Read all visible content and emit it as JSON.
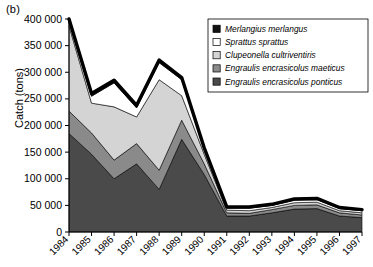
{
  "panel": {
    "label": "(b)"
  },
  "axis": {
    "ylabel": "Catch (tons)",
    "yticks": [
      "400 000",
      "350 000",
      "300 000",
      "250 000",
      "200 000",
      "150 000",
      "100 000",
      "50 000",
      "0"
    ],
    "xticks": [
      "1984",
      "1985",
      "1986",
      "1987",
      "1988",
      "1989",
      "1990",
      "1991",
      "1992",
      "1993",
      "1994",
      "1995",
      "1996",
      "1997"
    ]
  },
  "legend": {
    "items": [
      {
        "label": "Merlangius merlangus",
        "color": "#111111"
      },
      {
        "label": "Sprattus sprattus",
        "color": "#ffffff"
      },
      {
        "label": "Clupeonella cultriventiris",
        "color": "#d4d4d4"
      },
      {
        "label": "Engraulis encrasicolus maeticus",
        "color": "#8a8a8a"
      },
      {
        "label": "Engraulis encrasicolus ponticus",
        "color": "#4a4a4a"
      }
    ]
  },
  "chart_data": {
    "type": "area",
    "title": "",
    "xlabel": "",
    "ylabel": "Catch (tons)",
    "ylim": [
      0,
      400000
    ],
    "yticks": [
      0,
      50000,
      100000,
      150000,
      200000,
      250000,
      300000,
      350000,
      400000
    ],
    "grid": false,
    "legend_position": "top-right",
    "stacked": true,
    "stack_order_bottom_to_top": [
      "Engraulis encrasicolus ponticus",
      "Engraulis encrasicolus maeticus",
      "Clupeonella cultriventiris",
      "Sprattus sprattus",
      "Merlangius merlangus"
    ],
    "categories": [
      1984,
      1985,
      1986,
      1987,
      1988,
      1989,
      1990,
      1991,
      1992,
      1993,
      1994,
      1995,
      1996,
      1997
    ],
    "series": [
      {
        "name": "Engraulis encrasicolus ponticus",
        "color": "#4a4a4a",
        "values": [
          185000,
          146000,
          100000,
          128000,
          80000,
          174000,
          108000,
          30000,
          30000,
          36000,
          43000,
          44000,
          30000,
          27000
        ]
      },
      {
        "name": "Engraulis encrasicolus maeticus",
        "color": "#8a8a8a",
        "values": [
          42000,
          40000,
          35000,
          38000,
          36000,
          36000,
          20000,
          6000,
          5000,
          6000,
          7000,
          7000,
          6000,
          5000
        ]
      },
      {
        "name": "Clupeonella cultriventiris",
        "color": "#d4d4d4",
        "values": [
          160000,
          56000,
          100000,
          50000,
          170000,
          46000,
          18000,
          5000,
          5000,
          4000,
          5000,
          5000,
          4000,
          4000
        ]
      },
      {
        "name": "Sprattus sprattus",
        "color": "#ffffff",
        "values": [
          9000,
          13000,
          45000,
          17000,
          32000,
          30000,
          9000,
          4000,
          5000,
          4000,
          5000,
          5000,
          4000,
          4000
        ]
      },
      {
        "name": "Merlangius merlangus",
        "color": "#111111",
        "values": [
          4000,
          5000,
          5000,
          5000,
          5000,
          4000,
          3000,
          2000,
          2000,
          2000,
          2000,
          2000,
          2000,
          2000
        ]
      }
    ],
    "totals": [
      400000,
      260000,
      285000,
      238000,
      323000,
      290000,
      158000,
      47000,
      47000,
      52000,
      62000,
      63000,
      46000,
      42000
    ]
  }
}
